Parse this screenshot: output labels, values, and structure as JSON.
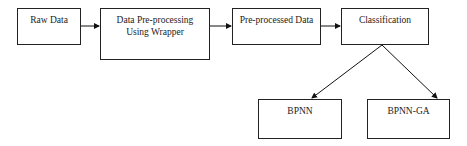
{
  "diagram": {
    "nodes": [
      {
        "id": "raw",
        "label": "Raw Data"
      },
      {
        "id": "pre",
        "label_line1": "Data Pre-processing",
        "label_line2": "Using Wrapper"
      },
      {
        "id": "preout",
        "label": "Pre-processed Data"
      },
      {
        "id": "class",
        "label": "Classification"
      },
      {
        "id": "bpnn",
        "label": "BPNN"
      },
      {
        "id": "bpnnga",
        "label": "BPNN-GA"
      }
    ],
    "edges": [
      {
        "from": "raw",
        "to": "pre"
      },
      {
        "from": "pre",
        "to": "preout"
      },
      {
        "from": "preout",
        "to": "class"
      },
      {
        "from": "class",
        "to": "bpnn"
      },
      {
        "from": "class",
        "to": "bpnnga"
      }
    ]
  }
}
